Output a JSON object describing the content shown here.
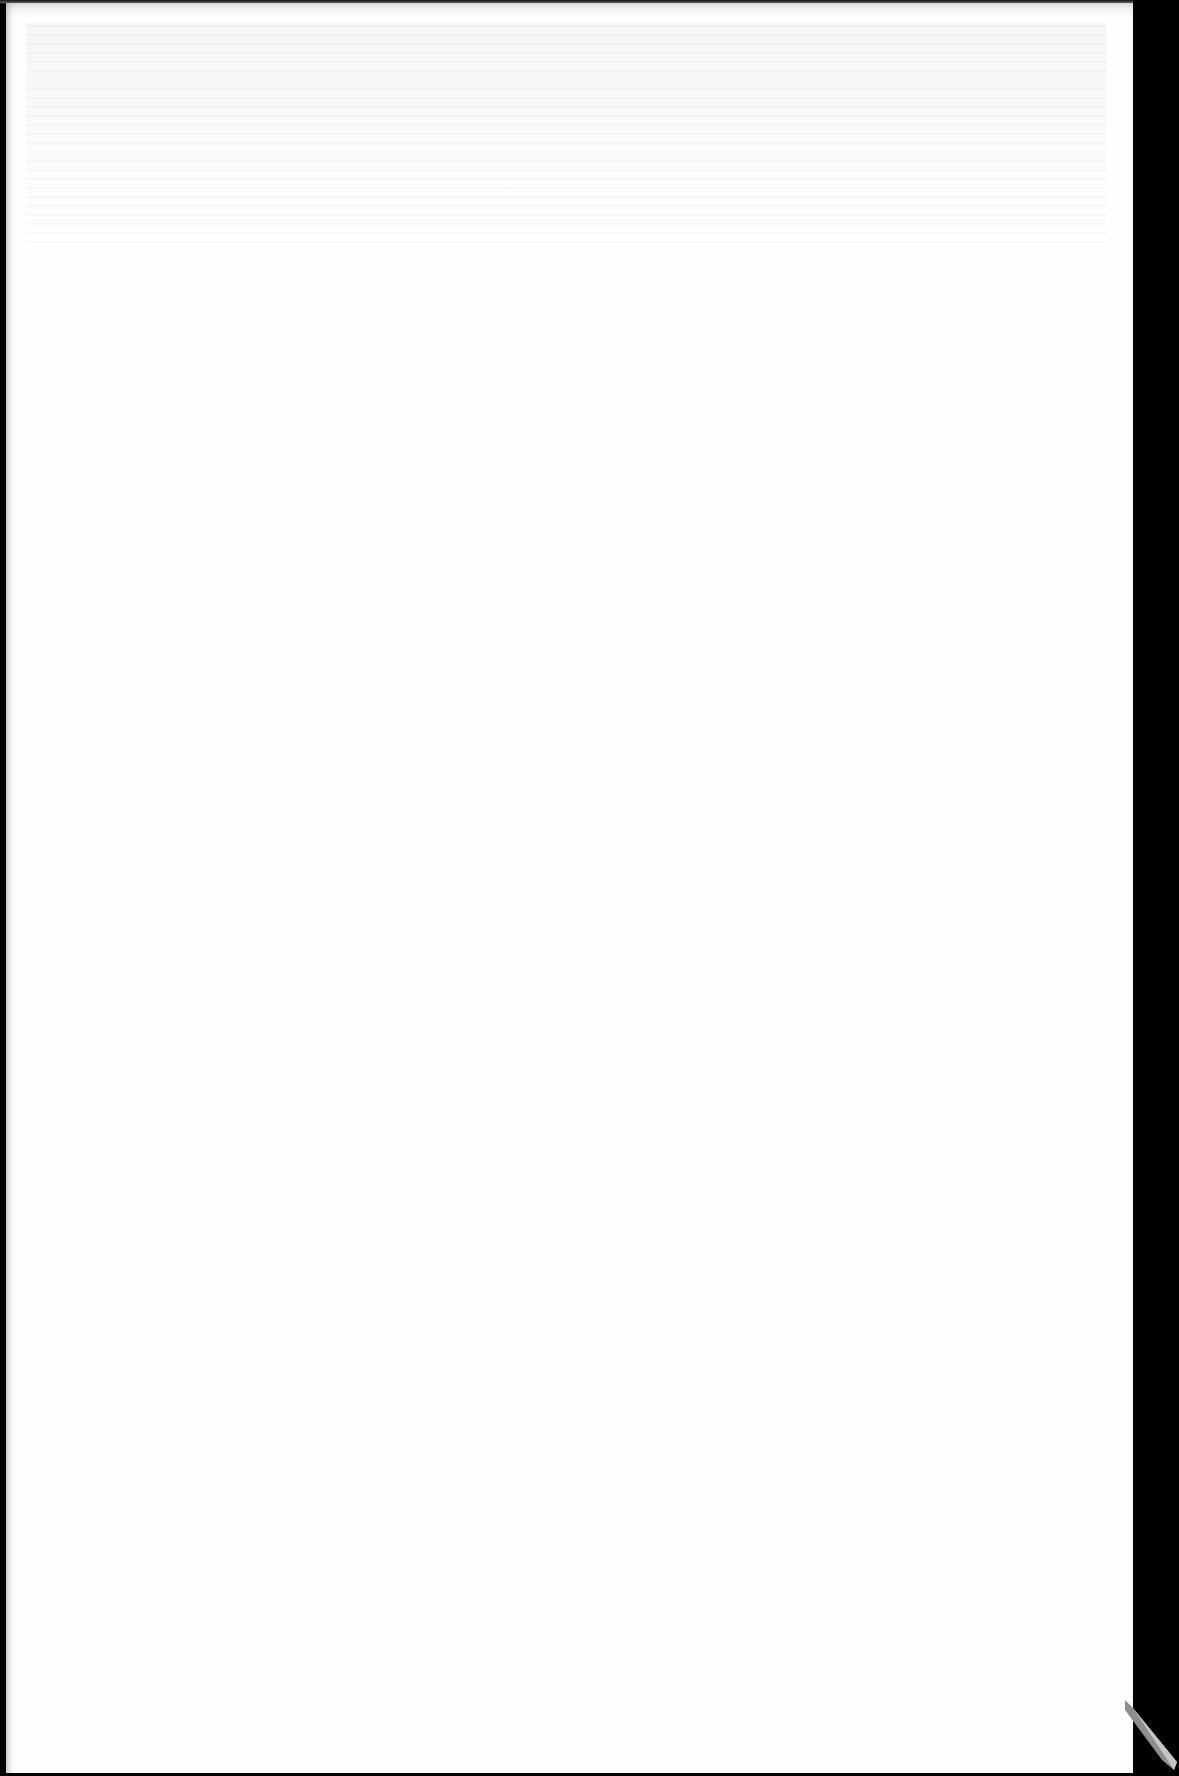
{
  "document": {
    "type": "scanned-page",
    "content_label": "",
    "page_color": "#fefefe",
    "background_color": "#000000",
    "corner_curl_color": "#9a9a9a"
  }
}
